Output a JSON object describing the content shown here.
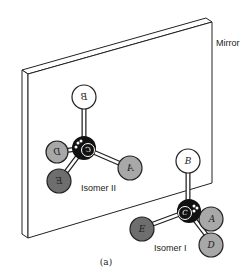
{
  "diagram": {
    "mirror_label": "Mirror",
    "caption": "(a)",
    "isomer_1": {
      "label": "Isomer I",
      "center_atom": "C",
      "atoms": [
        {
          "id": "B",
          "label": "B",
          "color": "#ffffff"
        },
        {
          "id": "A",
          "label": "A",
          "color": "#a8a8a8"
        },
        {
          "id": "D",
          "label": "D",
          "color": "#a8a8a8"
        },
        {
          "id": "E",
          "label": "E",
          "color": "#707070"
        }
      ]
    },
    "isomer_2": {
      "label": "Isomer II",
      "center_atom": "C",
      "atoms": [
        {
          "id": "B",
          "label": "B",
          "color": "#ffffff"
        },
        {
          "id": "A",
          "label": "A",
          "color": "#a8a8a8"
        },
        {
          "id": "D",
          "label": "D",
          "color": "#a8a8a8"
        },
        {
          "id": "E",
          "label": "E",
          "color": "#707070"
        }
      ]
    }
  }
}
